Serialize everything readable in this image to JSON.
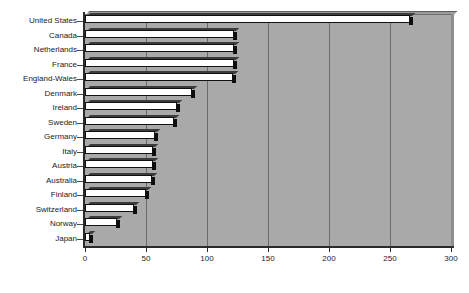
{
  "chart": {
    "type": "bar",
    "orientation": "horizontal",
    "title": "",
    "xlabel": "",
    "ylabel": "",
    "background_color": "#a9a9a9",
    "bar_color": "#ffffff",
    "bar_edge_color": "#111111",
    "grid": "vertical"
  },
  "chart_data": {
    "type": "bar",
    "orientation": "horizontal",
    "title": "",
    "xlabel": "",
    "ylabel": "",
    "xlim": [
      0,
      300
    ],
    "xticks": [
      0,
      50,
      100,
      150,
      200,
      250,
      300
    ],
    "xtick_labels": [
      "0",
      "50",
      "100",
      "150",
      "200",
      "250",
      "300"
    ],
    "grid": true,
    "legend": false,
    "categories": [
      "United States",
      "Canada",
      "Netherlands",
      "France",
      "England-Wales",
      "Denmark",
      "Ireland",
      "Sweden",
      "Germany",
      "Italy",
      "Austria",
      "Australia",
      "Finland",
      "Switzerland",
      "Norway",
      "Japan"
    ],
    "values": [
      266,
      122,
      122,
      122,
      121,
      88,
      75,
      73,
      57,
      56,
      56,
      55,
      50,
      40,
      26,
      4
    ]
  },
  "axis": {
    "ticks": [
      {
        "label": "0",
        "value": 0
      },
      {
        "label": "50",
        "value": 50
      },
      {
        "label": "100",
        "value": 100
      },
      {
        "label": "150",
        "value": 150
      },
      {
        "label": "200",
        "value": 200
      },
      {
        "label": "250",
        "value": 250
      },
      {
        "label": "300",
        "value": 300
      }
    ]
  }
}
